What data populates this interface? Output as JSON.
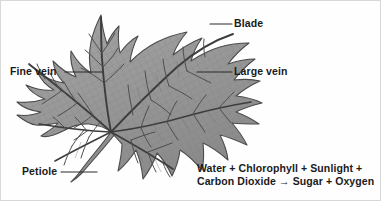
{
  "figure": {
    "background_color": "#fefefe",
    "border_color": "#d8d8d8",
    "text_color": "#1a1a1a",
    "leader_line_color": "#2b2b2b",
    "leaf_fill_color": "#9a9a9a",
    "leaf_outline_color": "#4a4a4a",
    "vein_color": "#3d3d3d",
    "fine_vein_color": "#6e6e6e"
  },
  "labels": {
    "blade": "Blade",
    "large_vein": "Large vein",
    "fine_vein": "Fine vein",
    "petiole": "Petiole"
  },
  "equation": {
    "line1": "Water + Chlorophyll + Sunlight +",
    "line2": "Carbon Dioxide → Sugar + Oxygen"
  }
}
